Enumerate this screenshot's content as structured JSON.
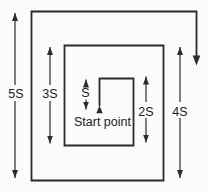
{
  "diagram": {
    "labels": {
      "dim_5s": "5S",
      "dim_3s": "3S",
      "dim_s": "S",
      "dim_2s": "2S",
      "dim_4s": "4S",
      "start_point": "Start point"
    },
    "colors": {
      "line": "#2b2b2b",
      "text": "#1c1c1c",
      "background": "#fbfbfb"
    }
  }
}
